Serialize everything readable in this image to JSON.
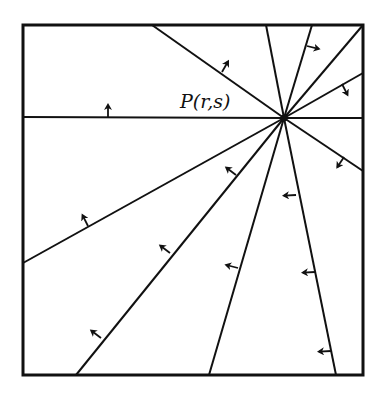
{
  "diagram": {
    "label": "P(r,s)",
    "colors": {
      "stroke": "#111111",
      "background": "#ffffff"
    },
    "frame": {
      "x1": 23,
      "y1": 25,
      "x2": 363,
      "y2": 375
    },
    "point": {
      "x": 284,
      "y": 118
    },
    "rays": [
      {
        "to": [
          23,
          117
        ],
        "arrow": {
          "at": [
            108,
            117
          ],
          "dir": [
            0,
            -1
          ]
        }
      },
      {
        "to": [
          152,
          25
        ],
        "arrow": {
          "at": [
            222,
            72
          ],
          "dir": [
            0.5,
            -0.87
          ]
        }
      },
      {
        "to": [
          266,
          25
        ]
      },
      {
        "to": [
          312,
          25
        ],
        "arrow": {
          "at": [
            307,
            46
          ],
          "dir": [
            0.97,
            0.24
          ]
        }
      },
      {
        "to": [
          363,
          25
        ]
      },
      {
        "to": [
          363,
          73
        ],
        "arrow": {
          "at": [
            342,
            84
          ],
          "dir": [
            0.45,
            0.89
          ]
        }
      },
      {
        "to": [
          363,
          118
        ]
      },
      {
        "to": [
          363,
          171
        ],
        "arrow": {
          "at": [
            344,
            157
          ],
          "dir": [
            -0.55,
            0.84
          ]
        }
      },
      {
        "to": [
          336,
          375
        ],
        "arrow": {
          "at": [
            315,
            272
          ],
          "dir": [
            -1,
            0.05
          ]
        }
      },
      {
        "to": [
          209,
          375
        ],
        "arrow": {
          "at": [
            238,
            268
          ],
          "dir": [
            -0.97,
            -0.25
          ]
        }
      },
      {
        "to": [
          76,
          375
        ],
        "arrow": {
          "at": [
            170,
            253
          ],
          "dir": [
            -0.8,
            -0.6
          ]
        }
      },
      {
        "to": [
          23,
          263
        ],
        "arrow": {
          "at": [
            88,
            226
          ],
          "dir": [
            -0.45,
            -0.89
          ]
        }
      },
      {
        "arrow": {
          "at": [
            101,
            338
          ],
          "dir": [
            -0.8,
            -0.6
          ]
        }
      },
      {
        "arrow": {
          "at": [
            236,
            175
          ],
          "dir": [
            -0.8,
            -0.6
          ]
        }
      },
      {
        "arrow": {
          "at": [
            296,
            195
          ],
          "dir": [
            -1,
            0.05
          ]
        }
      },
      {
        "arrow": {
          "at": [
            331,
            351
          ],
          "dir": [
            -1,
            0.05
          ]
        }
      },
      {
        "arrow": {
          "at": [
            315,
            272
          ],
          "dir": [
            -1,
            0.05
          ]
        }
      }
    ]
  }
}
